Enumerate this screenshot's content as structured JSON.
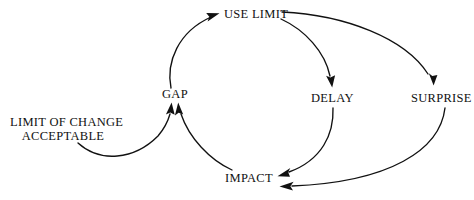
{
  "diagram": {
    "background_color": "#ffffff",
    "line_color": "#111111",
    "nodes": [
      {
        "id": "use_limit",
        "label": "USE LIMIT",
        "x": 250,
        "y": 14
      },
      {
        "id": "gap",
        "label": "GAP",
        "x": 174,
        "y": 94
      },
      {
        "id": "delay",
        "label": "DELAY",
        "x": 332,
        "y": 98
      },
      {
        "id": "surprise",
        "label": "SURPRISE",
        "x": 437,
        "y": 98
      },
      {
        "id": "impact",
        "label": "IMPACT",
        "x": 250,
        "y": 178
      },
      {
        "id": "limit_of_change",
        "label_line1": "LIMIT OF CHANGE",
        "label_line2": "ACCEPTABLE",
        "x": 62,
        "y": 129
      }
    ],
    "edges": [
      {
        "id": "gap-to-use-limit",
        "from": "GAP",
        "to": "USE LIMIT"
      },
      {
        "id": "use-limit-to-delay",
        "from": "USE LIMIT",
        "to": "DELAY"
      },
      {
        "id": "use-limit-to-surprise",
        "from": "USE LIMIT",
        "to": "SURPRISE"
      },
      {
        "id": "delay-to-impact",
        "from": "DELAY",
        "to": "IMPACT"
      },
      {
        "id": "surprise-to-impact",
        "from": "SURPRISE",
        "to": "IMPACT"
      },
      {
        "id": "impact-to-gap",
        "from": "IMPACT",
        "to": "GAP"
      },
      {
        "id": "limit-of-change-to-gap",
        "from": "LIMIT OF CHANGE ACCEPTABLE",
        "to": "GAP"
      }
    ]
  }
}
